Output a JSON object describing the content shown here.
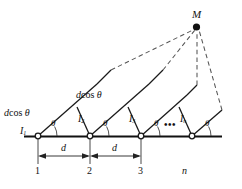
{
  "figure": {
    "colors": {
      "line": "#1a1a1a",
      "dashed": "#555555",
      "baseline": "#111111",
      "background": "#ffffff",
      "node_fill": "#ffffff"
    },
    "point_M": {
      "label": "M"
    },
    "path_difference_labels": [
      {
        "id": "pd1",
        "text_italic": "d",
        "text_upright": "cos",
        "symbol": "θ"
      },
      {
        "id": "pd2",
        "text_italic": "d",
        "text_upright": "cos",
        "symbol": "θ"
      }
    ],
    "source_labels": [
      {
        "id": "source-1",
        "base": "I",
        "sub": "1"
      },
      {
        "id": "source-2",
        "base": "I",
        "sub": "2"
      },
      {
        "id": "source-3",
        "base": "I",
        "sub": "3"
      },
      {
        "id": "source-n",
        "base": "I",
        "sub": "n"
      }
    ],
    "angle_labels": [
      {
        "id": "theta-1",
        "symbol": "θ"
      },
      {
        "id": "theta-2",
        "symbol": "θ"
      },
      {
        "id": "theta-3",
        "symbol": "θ"
      },
      {
        "id": "theta-4",
        "symbol": "θ"
      }
    ],
    "spacing_labels": [
      {
        "id": "spacing-d-1",
        "symbol": "d"
      },
      {
        "id": "spacing-d-2",
        "symbol": "d"
      }
    ],
    "index_labels": [
      {
        "id": "index-1",
        "text": "1"
      },
      {
        "id": "index-2",
        "text": "2"
      },
      {
        "id": "index-3",
        "text": "3"
      },
      {
        "id": "index-n",
        "text": "n"
      }
    ],
    "ellipsis": {
      "text": "•••"
    },
    "geometry": {
      "baseline_y": 136,
      "nodes_x": [
        38,
        90,
        141,
        192
      ],
      "M": {
        "x": 196,
        "y": 27
      },
      "ray_angle_deg": 30
    }
  }
}
